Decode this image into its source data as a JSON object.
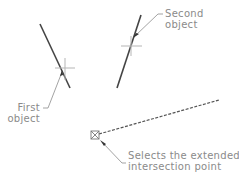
{
  "diagram": {
    "labels": {
      "first_object": [
        "First",
        "object"
      ],
      "second_object": [
        "Second",
        "object"
      ],
      "extended_point": [
        "Selects the extended",
        "intersection point"
      ]
    },
    "colors": {
      "object_line": "#444444",
      "leader": "#999999",
      "crosshair": "#b0b0b0",
      "dashed_line": "#555555",
      "text": "#8a8a8a"
    }
  }
}
